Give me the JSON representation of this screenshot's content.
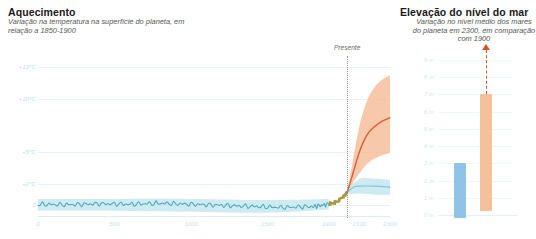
{
  "left_panel": {
    "title": "Aquecimento",
    "subtitle": "Variação na temperatura na superfície do planeta, em relação a 1850-1900"
  },
  "right_panel": {
    "title": "Elevação do nível do mar",
    "subtitle": "Variação no nível médio dos mares do planeta em 2300, em comparação com 1900"
  },
  "annotations": {
    "present_label": "Presente"
  },
  "colors": {
    "historical_line": "#4fa8bd",
    "historical_band": "#bfe4ee",
    "transition_line": "#a89a3c",
    "projection_line": "#d4603a",
    "projection_band": "#f6b58e",
    "low_scenario_band": "#bfe4ee",
    "bar_1900": "#8fc3e8",
    "bar_2300": "#f4c19a",
    "arrow": "#d8532a",
    "present_marker": "#9b8f8f",
    "axis_text": "#c5e4ef"
  },
  "chart_data": [
    {
      "type": "area",
      "title": "Aquecimento",
      "xlabel": "",
      "ylabel": "",
      "xlim": [
        0,
        2300
      ],
      "ylim": [
        -1,
        14
      ],
      "grid": true,
      "legend": "none",
      "xticks": [
        "0",
        "500",
        "1000",
        "1500",
        "1900",
        "2100",
        "2300"
      ],
      "xtick_values": [
        0,
        500,
        1000,
        1500,
        1900,
        2100,
        2300
      ],
      "yticks": [
        "+13°C",
        "+10°C",
        "+5°C",
        "+2°C",
        "0"
      ],
      "ytick_values": [
        13,
        10,
        5,
        2,
        0
      ],
      "present_year": 2020,
      "series": [
        {
          "name": "Reconstrução histórica",
          "color": "#4fa8bd",
          "x": [
            0,
            200,
            400,
            600,
            800,
            1000,
            1200,
            1400,
            1600,
            1800,
            1900
          ],
          "values": [
            0.1,
            0.05,
            0.15,
            0.1,
            0.2,
            0.1,
            0.0,
            -0.1,
            -0.2,
            -0.1,
            0.1
          ]
        },
        {
          "name": "Transição observada",
          "color": "#a89a3c",
          "x": [
            1900,
            1950,
            2000,
            2020
          ],
          "values": [
            0.1,
            0.3,
            0.9,
            1.2
          ]
        },
        {
          "name": "Projeção de altas emissões",
          "color": "#d4603a",
          "x": [
            2020,
            2050,
            2100,
            2150,
            2200,
            2250,
            2300
          ],
          "values": [
            1.2,
            2.6,
            5.0,
            6.6,
            7.4,
            7.9,
            8.2
          ]
        },
        {
          "name": "Projeção de baixas emissões",
          "color": "#7fc8dd",
          "x": [
            2020,
            2060,
            2100,
            2200,
            2300
          ],
          "values": [
            1.2,
            1.7,
            1.8,
            1.8,
            1.7
          ]
        }
      ],
      "bands": [
        {
          "name": "Incerteza histórica",
          "color": "#bfe4ee",
          "x": [
            0,
            500,
            1000,
            1500,
            1900
          ],
          "lower": [
            -0.5,
            -0.5,
            -0.6,
            -0.7,
            -0.4
          ],
          "upper": [
            0.6,
            0.6,
            0.6,
            0.5,
            0.6
          ]
        },
        {
          "name": "Incerteza de altas emissões",
          "color": "#f6b58e",
          "x": [
            2020,
            2050,
            2100,
            2150,
            2200,
            2250,
            2300
          ],
          "lower": [
            1.1,
            1.9,
            3.0,
            3.9,
            4.4,
            4.7,
            4.9
          ],
          "upper": [
            1.3,
            3.6,
            7.4,
            9.8,
            11.1,
            11.8,
            12.2
          ]
        },
        {
          "name": "Incerteza de baixas emissões",
          "color": "#bfe4ee",
          "x": [
            2020,
            2100,
            2200,
            2300
          ],
          "lower": [
            1.0,
            1.1,
            1.0,
            1.0
          ],
          "upper": [
            1.4,
            2.5,
            2.5,
            2.4
          ]
        }
      ]
    },
    {
      "type": "bar",
      "title": "Elevação do nível do mar",
      "xlabel": "",
      "ylabel": "",
      "ylim": [
        0,
        9
      ],
      "grid": true,
      "legend": "none",
      "yticks": [
        "9 m",
        "8 m",
        "7 m",
        "6 m",
        "5 m",
        "4 m",
        "3 m",
        "2 m",
        "1 m",
        "0 m"
      ],
      "ytick_values": [
        9,
        8,
        7,
        6,
        5,
        4,
        3,
        2,
        1,
        0
      ],
      "categories": [
        "Baixas emissões",
        "Altas emissões"
      ],
      "values": [
        3.0,
        7.0
      ],
      "bar_colors": [
        "#8fc3e8",
        "#f4c19a"
      ],
      "annotations": [
        {
          "name": "arrow-above-high-emissions",
          "from": 7.0,
          "to": 9.6,
          "style": "dashed-arrow-up",
          "color": "#d8532a"
        }
      ]
    }
  ]
}
